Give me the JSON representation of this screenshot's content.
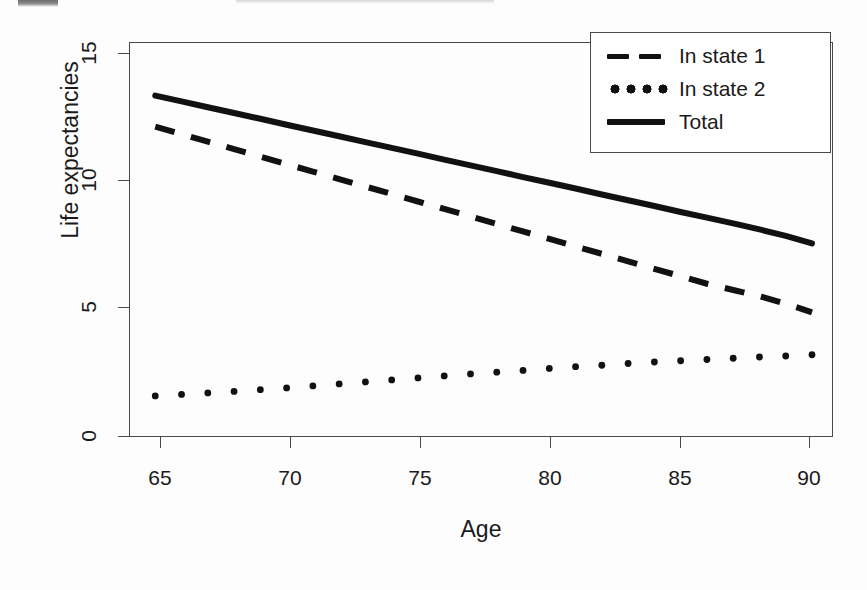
{
  "chart_data": {
    "type": "line",
    "title": "",
    "xlabel": "Age",
    "ylabel": "Life expectancies",
    "xlim": [
      64.0,
      90.8
    ],
    "ylim": [
      -0.35,
      15.5
    ],
    "xticks": [
      65,
      70,
      75,
      80,
      85,
      90
    ],
    "xticklabels": [
      "65",
      "70",
      "75",
      "80",
      "85",
      "90"
    ],
    "yticks": [
      0,
      5,
      10,
      15
    ],
    "yticklabels": [
      "0",
      "5",
      "10",
      "15"
    ],
    "grid": false,
    "legend_position": "top-right",
    "legend_entries": [
      "In state 1",
      "In state 2",
      "Total"
    ],
    "x": [
      65,
      66,
      67,
      68,
      69,
      70,
      71,
      72,
      73,
      74,
      75,
      76,
      77,
      78,
      79,
      80,
      81,
      82,
      83,
      84,
      85,
      86,
      87,
      88,
      89,
      90
    ],
    "series": [
      {
        "name": "In state 1",
        "style": "dashed",
        "color": "#111111",
        "values": [
          12.1,
          11.8,
          11.5,
          11.2,
          10.9,
          10.6,
          10.3,
          10.0,
          9.7,
          9.4,
          9.1,
          8.8,
          8.5,
          8.2,
          7.9,
          7.6,
          7.3,
          7.0,
          6.7,
          6.4,
          6.1,
          5.8,
          5.55,
          5.3,
          5.0,
          4.65
        ]
      },
      {
        "name": "In state 2",
        "style": "dotted",
        "color": "#111111",
        "values": [
          1.3,
          1.36,
          1.42,
          1.48,
          1.55,
          1.62,
          1.7,
          1.78,
          1.86,
          1.94,
          2.02,
          2.1,
          2.18,
          2.25,
          2.32,
          2.4,
          2.47,
          2.53,
          2.6,
          2.66,
          2.71,
          2.76,
          2.81,
          2.86,
          2.9,
          2.95
        ]
      },
      {
        "name": "Total",
        "style": "solid",
        "color": "#111111",
        "values": [
          13.35,
          13.12,
          12.88,
          12.65,
          12.42,
          12.18,
          11.95,
          11.72,
          11.48,
          11.25,
          11.02,
          10.78,
          10.55,
          10.32,
          10.08,
          9.85,
          9.62,
          9.38,
          9.15,
          8.92,
          8.68,
          8.45,
          8.22,
          7.98,
          7.72,
          7.42
        ]
      }
    ]
  },
  "legend": {
    "items": [
      {
        "label": "In state 1",
        "key": "dashed-line-key"
      },
      {
        "label": "In state 2",
        "key": "dotted-line-key"
      },
      {
        "label": "Total",
        "key": "solid-line-key"
      }
    ]
  },
  "axes": {
    "x_title": "Age",
    "y_title": "Life expectancies",
    "x_tick_labels": [
      "65",
      "70",
      "75",
      "80",
      "85",
      "90"
    ],
    "y_tick_labels": [
      "15",
      "10",
      "5",
      "0"
    ]
  }
}
